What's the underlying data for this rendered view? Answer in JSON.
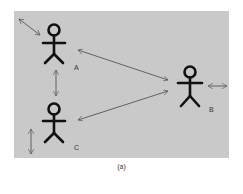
{
  "figure": {
    "caption": "(a)",
    "background_color": "#c9c9c9",
    "actors": [
      {
        "id": "A",
        "label": "A"
      },
      {
        "id": "B",
        "label": "B"
      },
      {
        "id": "C",
        "label": "C"
      }
    ],
    "connections": [
      {
        "from": "A",
        "to": "B",
        "type": "bidirectional-arrow"
      },
      {
        "from": "C",
        "to": "B",
        "type": "bidirectional-arrow"
      },
      {
        "from": "A",
        "to": "C",
        "type": "bidirectional-arrow"
      }
    ],
    "movement_indicators": [
      {
        "actor": "A",
        "direction": "diagonal"
      },
      {
        "actor": "B",
        "direction": "horizontal"
      },
      {
        "actor": "C",
        "direction": "vertical"
      }
    ]
  }
}
